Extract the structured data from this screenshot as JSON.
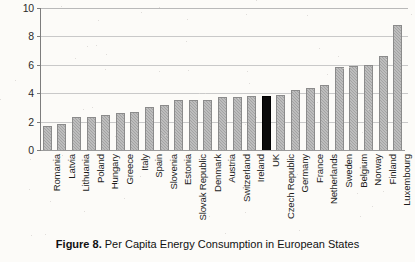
{
  "caption": {
    "label": "Figure 8.",
    "text": "Per Capita Energy Consumption in European States"
  },
  "chart_data": {
    "type": "bar",
    "title": "",
    "xlabel": "",
    "ylabel": "Per Capita TPES, GJ/year",
    "ylim": [
      0,
      10
    ],
    "yticks": [
      0,
      2,
      4,
      6,
      8,
      10
    ],
    "ytick_labels": [
      "0",
      "2",
      "4",
      "6",
      "8",
      "10"
    ],
    "grid": true,
    "legend": "none",
    "highlight_category": "UK",
    "highlight_color": "#0b0b0b",
    "bar_color": "#a9a9a9",
    "categories": [
      "Romania",
      "Latvia",
      "Lithuania",
      "Poland",
      "Hungary",
      "Greece",
      "Italy",
      "Spain",
      "Slovenia",
      "Estonia",
      "Slovak Republic",
      "Denmark",
      "Austria",
      "Switzerland",
      "Ireland",
      "UK",
      "Czech Republic",
      "Germany",
      "France",
      "Netherlands",
      "Sweden",
      "Belgium",
      "Norway",
      "Finland",
      "Luxembourg"
    ],
    "values": [
      1.7,
      1.85,
      2.3,
      2.35,
      2.5,
      2.6,
      2.65,
      3.05,
      3.2,
      3.5,
      3.5,
      3.55,
      3.75,
      3.75,
      3.8,
      3.8,
      3.85,
      4.25,
      4.35,
      4.6,
      5.85,
      5.9,
      6.0,
      6.6,
      8.8
    ]
  }
}
